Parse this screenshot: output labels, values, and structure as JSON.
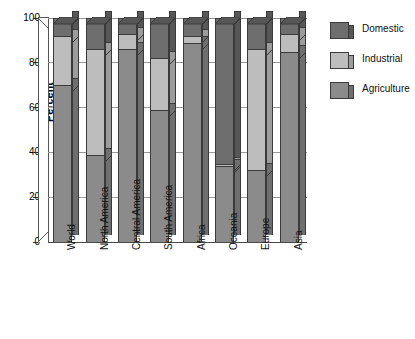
{
  "chart_data": {
    "type": "bar",
    "subtype": "stacked-percentage-3d",
    "title": "",
    "xlabel": "",
    "ylabel": "Percent",
    "ylim": [
      0,
      100
    ],
    "yticks": [
      0,
      20,
      40,
      60,
      80,
      100
    ],
    "ytick_labels": [
      "0",
      "20",
      "40",
      "60",
      "80",
      "100"
    ],
    "grid": true,
    "legend_position": "right",
    "categories": [
      "World",
      "North America",
      "Central America",
      "South America",
      "Africa",
      "Oceania",
      "Europe",
      "Asia"
    ],
    "series": [
      {
        "name": "Agriculture",
        "color": "#8b8b8b",
        "side_color": "#6f6f6f",
        "values": [
          70,
          39,
          86,
          59,
          89,
          34,
          32,
          85
        ]
      },
      {
        "name": "Industrial",
        "color": "#bdbdbd",
        "side_color": "#9c9c9c",
        "values": [
          22,
          47,
          7,
          23,
          3,
          1,
          54,
          8
        ]
      },
      {
        "name": "Domestic",
        "color": "#6e6e6e",
        "side_color": "#575757",
        "values": [
          8,
          14,
          7,
          18,
          8,
          65,
          14,
          7
        ]
      }
    ],
    "stack_order_bottom_to_top": [
      "Agriculture",
      "Industrial",
      "Domestic"
    ]
  },
  "legend": {
    "items": [
      {
        "label": "Domestic",
        "color": "#6e6e6e",
        "side_color": "#575757"
      },
      {
        "label": "Industrial",
        "color": "#bdbdbd",
        "side_color": "#9c9c9c"
      },
      {
        "label": "Agriculture",
        "color": "#8b8b8b",
        "side_color": "#6f6f6f"
      }
    ]
  },
  "axis": {
    "y_title": "Percent"
  },
  "colors": {
    "domestic": "#6e6e6e",
    "industrial": "#bdbdbd",
    "agriculture": "#8b8b8b",
    "gridline": "#9a9a9a",
    "outline": "#3a3a3a",
    "background": "#ffffff"
  }
}
